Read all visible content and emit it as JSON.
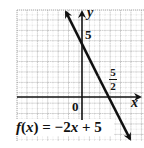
{
  "chart_data": {
    "type": "line",
    "title": "",
    "function": "f(x) = -2x + 5",
    "series": [
      {
        "name": "f(x) = -2x + 5",
        "slope": -2,
        "intercept": 5,
        "x": [
          -1.5,
          0,
          2.5,
          4.5
        ],
        "y": [
          8,
          5,
          0,
          -4
        ]
      }
    ],
    "xlabel": "x",
    "ylabel": "y",
    "annotations": [
      {
        "text": "5",
        "meaning": "y-intercept",
        "x": 0,
        "y": 5
      },
      {
        "text": "5/2",
        "meaning": "x-intercept",
        "x": 2.5,
        "y": 0
      },
      {
        "text": "0",
        "meaning": "origin",
        "x": 0,
        "y": 0
      }
    ],
    "xlim": [
      -6.3,
      5.9
    ],
    "ylim": [
      -4.2,
      8.4
    ],
    "grid": true,
    "legend": "none"
  },
  "labels": {
    "y_axis": "y",
    "x_axis": "x",
    "y_intercept": "5",
    "x_intercept_num": "5",
    "x_intercept_den": "2",
    "origin": "0",
    "equation": "f(x) = −2x + 5"
  },
  "colors": {
    "line": "#111111",
    "grid": "#9a9a9a",
    "background": "#ffffff"
  }
}
